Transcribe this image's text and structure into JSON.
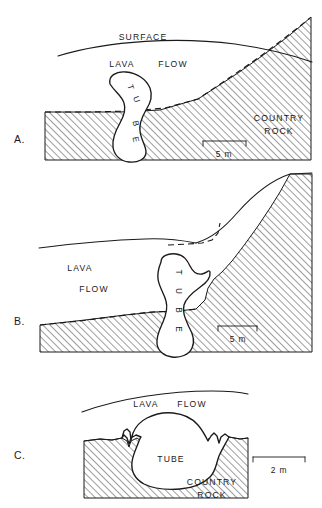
{
  "figure": {
    "type": "geological-cross-section-diagram",
    "background_color": "#ffffff",
    "line_color": "#1a1a1a"
  },
  "panels": [
    {
      "id": "A",
      "letter": "A.",
      "labels": {
        "surface": "SURFACE",
        "lava": "LAVA",
        "flow": "FLOW",
        "country": "COUNTRY",
        "rock": "ROCK"
      },
      "tube_label": "TUBE",
      "tube_letters": [
        "T",
        "U",
        "B",
        "E"
      ],
      "scale": {
        "value": "5 m",
        "length_px": 52
      }
    },
    {
      "id": "B",
      "letter": "B.",
      "labels": {
        "lava": "LAVA",
        "flow": "FLOW"
      },
      "tube_label": "TUBE",
      "tube_letters": [
        "T",
        "U",
        "B",
        "E"
      ],
      "scale": {
        "value": "5 m",
        "length_px": 42
      }
    },
    {
      "id": "C",
      "letter": "C.",
      "labels": {
        "lava": "LAVA",
        "flow": "FLOW",
        "country": "COUNTRY",
        "rock": "ROCK"
      },
      "tube_label": "TUBE",
      "scale": {
        "value": "2 m",
        "length_px": 50
      }
    }
  ]
}
